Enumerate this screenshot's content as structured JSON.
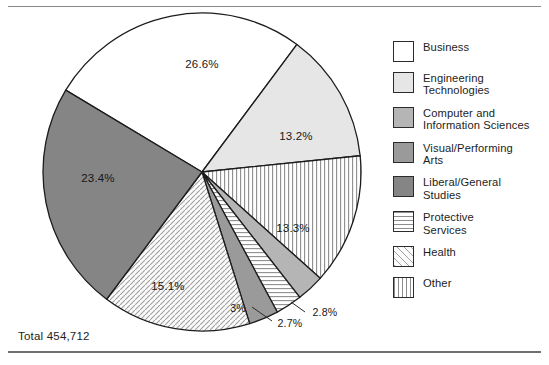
{
  "figure": {
    "total_caption": "Total 454,712",
    "cropped_title": ""
  },
  "legend": {
    "items": [
      {
        "label": "Business",
        "pattern": "solid",
        "color": "#ffffff"
      },
      {
        "label": "Engineering\nTechnologies",
        "pattern": "solid",
        "color": "#e6e6e6"
      },
      {
        "label": "Computer and\nInformation Sciences",
        "pattern": "solid",
        "color": "#b5b5b5"
      },
      {
        "label": "Visual/Performing\nArts",
        "pattern": "solid",
        "color": "#9a9a9a"
      },
      {
        "label": "Liberal/General\nStudies",
        "pattern": "solid",
        "color": "#858585"
      },
      {
        "label": "Protective\nServices",
        "pattern": "horizontal-lines",
        "color": "#f2f2f2"
      },
      {
        "label": "Health",
        "pattern": "diagonal-hatch",
        "color": "#ededed"
      },
      {
        "label": "Other",
        "pattern": "vertical-lines",
        "color": "#f4f4f4"
      }
    ]
  },
  "chart_data": {
    "type": "pie",
    "title": "",
    "total": "454,712",
    "total_value": 454712,
    "legend_position": "right",
    "start_angle_deg": -59,
    "direction": "clockwise",
    "labels": [
      "Business",
      "Engineering Technologies",
      "Other",
      "Computer and Information Sciences",
      "Protective Services",
      "Visual/Performing Arts",
      "Health",
      "Liberal/General Studies"
    ],
    "values": [
      26.6,
      13.2,
      13.3,
      2.8,
      2.7,
      3.0,
      15.1,
      23.4
    ],
    "value_labels": [
      "26.6%",
      "13.2%",
      "13.3%",
      "2.8%",
      "2.7%",
      "3%",
      "15.1%",
      "23.4%"
    ],
    "patterns": [
      "solid",
      "solid",
      "vertical-lines",
      "solid",
      "horizontal-lines",
      "solid",
      "diagonal-hatch",
      "solid"
    ],
    "colors": [
      "#ffffff",
      "#e6e6e6",
      "#f4f4f4",
      "#b5b5b5",
      "#f2f2f2",
      "#9a9a9a",
      "#ededed",
      "#858585"
    ],
    "label_placement": [
      "inside",
      "inside",
      "inside",
      "outside-leader",
      "outside-leader",
      "inside",
      "inside",
      "inside"
    ]
  }
}
